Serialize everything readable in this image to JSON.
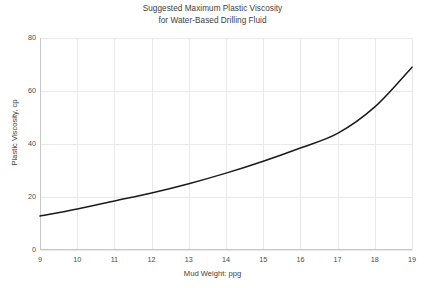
{
  "chart_data": {
    "type": "line",
    "title": "Suggested Maximum Plastic Viscosity for Water-Based Drilling Fluid",
    "title_lines": [
      "Suggested Maximum Plastic Viscosity",
      "for Water-Based Drilling Fluid"
    ],
    "xlabel": "Mud Weight: ppg",
    "ylabel": "Plastic Viscosity, cp",
    "x": [
      9,
      10,
      11,
      12,
      13,
      14,
      15,
      16,
      17,
      18,
      19
    ],
    "values": [
      12.8,
      15.5,
      18.5,
      21.5,
      25.0,
      29.0,
      33.5,
      38.5,
      44.0,
      54.0,
      69.0
    ],
    "series": [
      {
        "name": "Suggested maximum plastic viscosity",
        "values": [
          12.8,
          15.5,
          18.5,
          21.5,
          25.0,
          29.0,
          33.5,
          38.5,
          44.0,
          54.0,
          69.0
        ],
        "color": "#1a1a1a"
      }
    ],
    "xlim": [
      9,
      19
    ],
    "ylim": [
      0,
      80
    ],
    "xticks": [
      9,
      10,
      11,
      12,
      13,
      14,
      15,
      16,
      17,
      18,
      19
    ],
    "yticks": [
      0,
      20,
      40,
      60,
      80
    ],
    "xtick_labels": [
      "9",
      "10",
      "11",
      "12",
      "13",
      "14",
      "15",
      "16",
      "17",
      "18",
      "19"
    ],
    "ytick_labels": [
      "0",
      "20",
      "40",
      "60",
      "80"
    ],
    "grid": true,
    "grid_color": "#e9e9e9",
    "axis_color": "#c8c8c8",
    "legend": null,
    "legend_position": "none",
    "background": "#ffffff"
  },
  "caption": {
    "text": ""
  }
}
